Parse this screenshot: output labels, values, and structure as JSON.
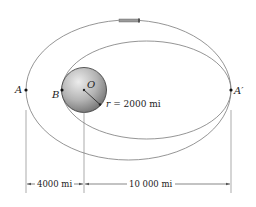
{
  "diagram": {
    "points": {
      "A": "A",
      "A_prime": "A′",
      "B": "B",
      "O": "O"
    },
    "radius_label": {
      "var": "r",
      "text": " = 2000 mi"
    },
    "dimensions": {
      "left": "4000 mi",
      "right": "10 000 mi"
    },
    "colors": {
      "orbit": "#777777",
      "planet_light": "#e6e6e6",
      "planet_dark": "#7a7a7a",
      "text": "#222222"
    }
  }
}
